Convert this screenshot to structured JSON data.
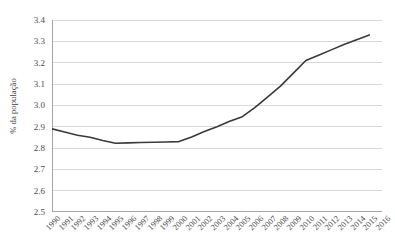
{
  "chart_data": {
    "type": "line",
    "title": "",
    "xlabel": "",
    "ylabel": "% da população",
    "ylim": [
      2.5,
      3.4
    ],
    "ytick_step": 0.1,
    "yticks": [
      "3.4",
      "3.3",
      "3.2",
      "3.1",
      "3.0",
      "2.9",
      "2.8",
      "2.7",
      "2.6",
      "2.5"
    ],
    "grid": "horizontal",
    "legend": "none",
    "line_color": "#3a3a3a",
    "gridline_color": "#d9d9d9",
    "axis_color": "#a6a6a6",
    "background_color": "#ffffff",
    "categories": [
      "1990",
      "1991",
      "1992",
      "1993",
      "1994",
      "1995",
      "1996",
      "1997",
      "1998",
      "1999",
      "2000",
      "2001",
      "2002",
      "2003",
      "2004",
      "2005",
      "2006",
      "2007",
      "2008",
      "2009",
      "2010",
      "2011",
      "2012",
      "2013",
      "2014",
      "2015",
      "2016"
    ],
    "values": [
      2.89,
      2.875,
      2.86,
      2.85,
      2.835,
      2.822,
      2.824,
      2.826,
      2.827,
      2.828,
      2.83,
      2.852,
      2.877,
      2.9,
      2.925,
      2.947,
      2.99,
      3.04,
      3.09,
      3.15,
      3.21,
      3.235,
      3.26,
      3.285,
      3.308,
      3.33,
      null
    ],
    "series": [
      {
        "name": "% da população",
        "values": [
          2.89,
          2.875,
          2.86,
          2.85,
          2.835,
          2.822,
          2.824,
          2.826,
          2.827,
          2.828,
          2.83,
          2.852,
          2.877,
          2.9,
          2.925,
          2.947,
          2.99,
          3.04,
          3.09,
          3.15,
          3.21,
          3.235,
          3.26,
          3.285,
          3.308,
          3.33,
          null
        ]
      }
    ]
  }
}
